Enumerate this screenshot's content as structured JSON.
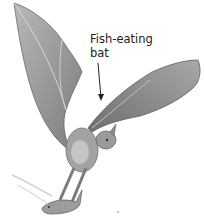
{
  "illustration": {
    "subject": "fish-eating bat in flight carrying a fish",
    "label": {
      "line1": "Fish-eating",
      "line2": "bat"
    },
    "colors": {
      "background": "#ffffff",
      "wing": "#8a8a8a",
      "wing_light": "#b5b5b5",
      "body": "#a0a0a0",
      "text": "#222222"
    }
  }
}
